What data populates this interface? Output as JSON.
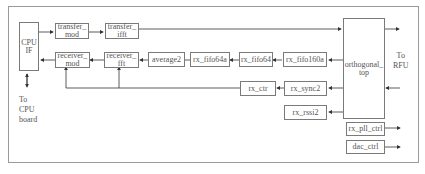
{
  "diagram": {
    "blocks": {
      "cpu_if": "CPU\nIF",
      "transfer_mod": "transfer_\nmod",
      "transfer_ifft": "transfer_\nifft",
      "receiver_mod": "receiver_\nmod",
      "receiver_fft": "receiver_\nfft",
      "average2": "average2",
      "rx_fifo64a": "rx_fifo64a",
      "rx_fifo64": "rx_fifo64",
      "rx_fifo160a": "rx_fifo160a",
      "orthogonal_top": "orthogonal_\ntop",
      "rx_ctr": "rx_ctr",
      "rx_sync2": "rx_sync2",
      "rx_rssi2": "rx_rssi2",
      "rx_pll_ctrl": "rx_pll_ctrl",
      "dac_ctrl": "dac_ctrl"
    },
    "labels": {
      "to_rfu": "To\nRFU",
      "to_cpu_board": "To\nCPU\nboard"
    },
    "colors": {
      "line": "#333333",
      "border": "#7a7a7a",
      "text": "#555555"
    }
  }
}
